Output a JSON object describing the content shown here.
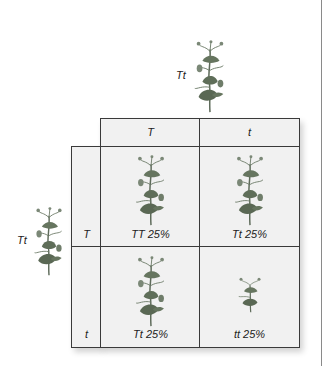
{
  "parents": {
    "top": {
      "genotype": "Tt"
    },
    "left": {
      "genotype": "Tt"
    }
  },
  "column_headers": [
    "T",
    "t"
  ],
  "row_headers": [
    "T",
    "t"
  ],
  "offspring": [
    {
      "genotype": "TT",
      "percent": "25%",
      "label": "TT 25%",
      "phenotype": "tall"
    },
    {
      "genotype": "Tt",
      "percent": "25%",
      "label": "Tt 25%",
      "phenotype": "tall"
    },
    {
      "genotype": "Tt",
      "percent": "25%",
      "label": "Tt 25%",
      "phenotype": "tall"
    },
    {
      "genotype": "tt",
      "percent": "25%",
      "label": "tt 25%",
      "phenotype": "short"
    }
  ],
  "colors": {
    "cell_fill": "#f1f1f1",
    "border": "#3a3a3a",
    "plant_leaf": "#6f7d6a",
    "plant_stem": "#5e6b5a"
  },
  "icons": {
    "plant": "pea-plant-icon"
  }
}
